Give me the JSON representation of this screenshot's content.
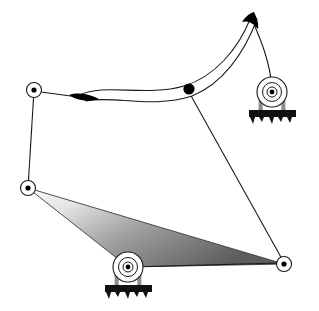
{
  "figure": {
    "type": "technical-line-drawing",
    "width": 319,
    "height": 311,
    "background_color": "#ffffff",
    "stroke_color": "#000000",
    "stroke_width": 1
  },
  "colors": {
    "outline": "#1a1a1a",
    "fill_black": "#000000",
    "ground_hatch": "#111111",
    "ternary_gradient_light": "#f4f4f4",
    "ternary_gradient_mid": "#9a9a9a",
    "ternary_gradient_dark": "#5f5f5f",
    "bearing_body": "#ffffff",
    "bearing_leg": "#8c8c8c"
  },
  "joints": [
    {
      "id": "J1",
      "name": "upper-left-pivot",
      "kind": "revolute-moving",
      "x": 34,
      "y": 90,
      "outer_radius": 7.5,
      "dot_radius": 2.6
    },
    {
      "id": "J2",
      "name": "lower-left-pivot",
      "kind": "revolute-moving",
      "x": 28,
      "y": 188,
      "outer_radius": 7.5,
      "dot_radius": 2.6
    },
    {
      "id": "J3",
      "name": "lower-right-pivot",
      "kind": "revolute-moving",
      "x": 284,
      "y": 264,
      "outer_radius": 7.5,
      "dot_radius": 2.6
    },
    {
      "id": "J4",
      "name": "coupler-point",
      "kind": "solid-marker",
      "x": 189,
      "y": 89,
      "outer_radius": 5.6,
      "dot_radius": 5.6
    }
  ],
  "ground_bearings": [
    {
      "id": "G1",
      "name": "upper-right-ground-bearing",
      "x": 272,
      "y": 92,
      "outer_radius": 15,
      "mid_radius": 9.5,
      "inner_radius": 5,
      "dot_radius": 2.4,
      "leg_span": 26,
      "leg_height": 18,
      "base_width": 46,
      "base_height": 8,
      "hatch_depth": 8
    },
    {
      "id": "G2",
      "name": "bottom-center-ground-bearing",
      "x": 128,
      "y": 267,
      "outer_radius": 15,
      "mid_radius": 9.5,
      "inner_radius": 5,
      "dot_radius": 2.4,
      "leg_span": 26,
      "leg_height": 18,
      "base_width": 46,
      "base_height": 8,
      "hatch_depth": 8
    }
  ],
  "links": [
    {
      "id": "L1",
      "name": "left-crank-link",
      "from": "J1",
      "to": "J2",
      "path": "M 34 90 L 28 188"
    },
    {
      "id": "L2",
      "name": "upper-left-connector-link",
      "from": "J1",
      "to": "curved-band-left-cusp",
      "path": "M 40 91 L 92 98"
    },
    {
      "id": "L3",
      "name": "coupler-point-to-lower-right-link",
      "from": "J4",
      "to": "J3",
      "path": "M 190 94 L 281 258"
    },
    {
      "id": "L4",
      "name": "top-cusp-to-ground-bearing-link",
      "from": "curved-band-top-cusp",
      "to": "G1",
      "path": "M 253 20 C 262 40, 270 62, 272 90"
    },
    {
      "id": "L5",
      "name": "ternary-link-lower-edge",
      "from": "G2",
      "to": "J3",
      "path": "M 128 267 L 277 263"
    }
  ],
  "curved_band": {
    "id": "C1",
    "name": "curved-coupler-band",
    "description": "Crescent / banana shaped coupler band with two pointed black cusps",
    "outer_path": "M 84 96 C 110 84, 150 98, 186 88 C 214 80, 238 52, 253 19",
    "inner_path": "M 84 99 C 112 92, 152 106, 190 98 C 222 90, 246 56, 259 20",
    "left_cusp": {
      "name": "left-cusp",
      "path": "M 72 96 C 82 94, 92 96, 99 100 C 90 102, 79 101, 72 96 Z",
      "tip_x": 72,
      "tip_y": 96
    },
    "top_cusp": {
      "name": "top-cusp",
      "path": "M 253 14 C 257 20, 259 25, 258 29 C 253 24, 248 21, 243 22 C 246 18, 250 15, 253 14 Z",
      "tip_x": 254,
      "tip_y": 13
    }
  },
  "ternary_plate": {
    "id": "T1",
    "name": "ternary-gradient-plate",
    "description": "Shaded triangular ternary link spanning the three lower joints",
    "vertices": [
      {
        "x": 28,
        "y": 188
      },
      {
        "x": 128,
        "y": 267
      },
      {
        "x": 284,
        "y": 264
      }
    ],
    "gradient": {
      "type": "linear",
      "angle_deg": 28,
      "stops": [
        {
          "offset": "0%",
          "color": "#fbfbfb"
        },
        {
          "offset": "22%",
          "color": "#e3e3e3"
        },
        {
          "offset": "55%",
          "color": "#9e9e9e"
        },
        {
          "offset": "100%",
          "color": "#5d5d5d"
        }
      ]
    }
  },
  "ground_hatch_pattern": {
    "name": "ground-hatch",
    "description": "Solid black bar with irregular triangular teeth pointing downward"
  }
}
